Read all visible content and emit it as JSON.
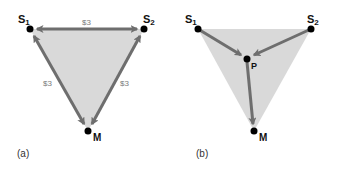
{
  "colors": {
    "fill": "#d9d9d9",
    "arrow": "#6e6e6e",
    "node": "#000000",
    "cost_text": "#7a7a7a"
  },
  "panel_a": {
    "caption": "(a)",
    "nodes": {
      "s1": {
        "label": "S",
        "sub": "1"
      },
      "s2": {
        "label": "S",
        "sub": "2"
      },
      "m": {
        "label": "M"
      }
    },
    "edges": [
      {
        "from": "S1",
        "to": "S2",
        "cost": "$3",
        "direction": "bidirectional"
      },
      {
        "from": "S1",
        "to": "M",
        "cost": "$3",
        "direction": "bidirectional"
      },
      {
        "from": "S2",
        "to": "M",
        "cost": "$3",
        "direction": "bidirectional"
      }
    ]
  },
  "panel_b": {
    "caption": "(b)",
    "nodes": {
      "s1": {
        "label": "S",
        "sub": "1"
      },
      "s2": {
        "label": "S",
        "sub": "2"
      },
      "p": {
        "label": "P"
      },
      "m": {
        "label": "M"
      }
    },
    "edges": [
      {
        "from": "S1",
        "to": "P",
        "direction": "forward"
      },
      {
        "from": "S2",
        "to": "P",
        "direction": "forward"
      },
      {
        "from": "P",
        "to": "M",
        "direction": "forward"
      }
    ]
  }
}
